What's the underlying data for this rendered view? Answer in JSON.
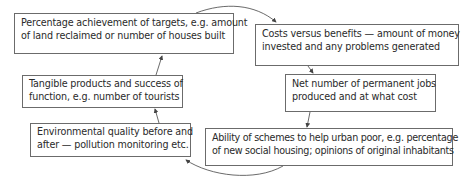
{
  "diagram": {
    "type": "cycle",
    "boxes": [
      {
        "id": "targets",
        "lines": [
          "Percentage achievement of targets, e.g. amount",
          "of land reclaimed or number of houses built"
        ]
      },
      {
        "id": "costs",
        "lines": [
          "Costs versus benefits — amount of money",
          "invested and any problems generated"
        ]
      },
      {
        "id": "jobs",
        "lines": [
          "Net number of permanent jobs",
          "produced and at what cost"
        ]
      },
      {
        "id": "urban-poor",
        "lines": [
          "Ability of schemes to help urban poor, e.g. percentage",
          "of new social housing; opinions of original inhabitants"
        ]
      },
      {
        "id": "environment",
        "lines": [
          "Environmental quality before and",
          "after — pollution monitoring etc."
        ]
      },
      {
        "id": "tangible",
        "lines": [
          "Tangible products and success of",
          "function, e.g. number of tourists"
        ]
      }
    ],
    "flow": [
      "targets",
      "costs",
      "jobs",
      "urban-poor",
      "environment",
      "tangible",
      "targets"
    ],
    "colors": {
      "border": "#6b6b6b",
      "text": "#2a2a2a",
      "arrow": "#444444"
    }
  }
}
